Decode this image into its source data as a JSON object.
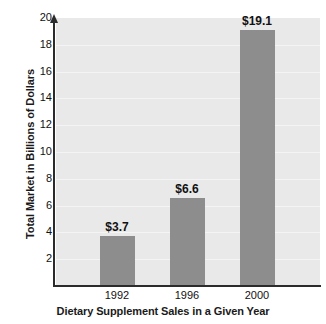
{
  "chart_data": {
    "type": "bar",
    "title": "",
    "categories": [
      "1992",
      "1996",
      "2000"
    ],
    "values": [
      3.7,
      6.6,
      19.1
    ],
    "value_labels": [
      "$3.7",
      "$6.6",
      "$19.1"
    ],
    "xlabel": "Dietary Supplement Sales in a Given Year",
    "ylabel": "Total Market in Billions of Dollars",
    "ylim": [
      0,
      20
    ],
    "ytick_labels": [
      "2",
      "4",
      "6",
      "8",
      "10",
      "12",
      "14",
      "16",
      "18",
      "20"
    ],
    "ytick_values": [
      2,
      4,
      6,
      8,
      10,
      12,
      14,
      16,
      18,
      20
    ],
    "grid": true,
    "grid_orientation": "horizontal",
    "legend": "none",
    "colors": {
      "bar": "#8d8d8d",
      "plot_background": "#e9e9e9",
      "gridline": "#f4f4f4",
      "axis": "#2b2b2b",
      "text": "#111111",
      "page_background": "#ffffff"
    }
  }
}
